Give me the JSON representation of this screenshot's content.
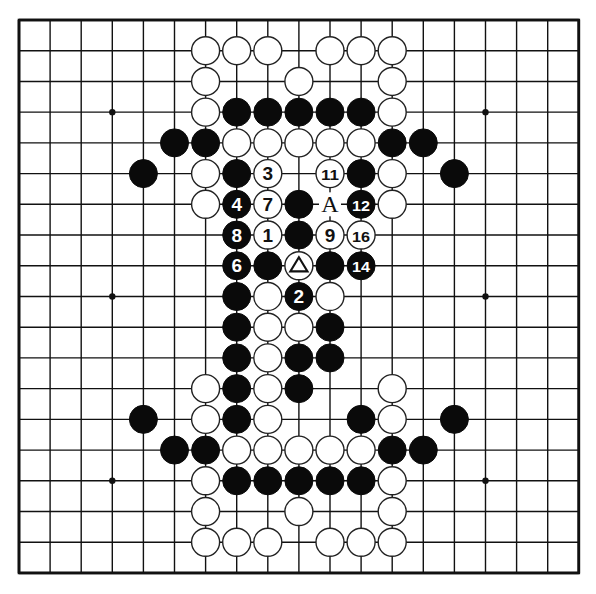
{
  "board": {
    "size": 19,
    "origin_x": 19,
    "origin_y": 20,
    "spacing_x": 31.1,
    "spacing_y": 30.72,
    "stone_radius": 14,
    "line_color": "#111111",
    "border_width": 2.6,
    "line_width": 1.4,
    "star_points": [
      [
        3,
        3
      ],
      [
        9,
        3
      ],
      [
        15,
        3
      ],
      [
        3,
        9
      ],
      [
        15,
        9
      ],
      [
        3,
        15
      ],
      [
        9,
        15
      ],
      [
        15,
        15
      ]
    ]
  },
  "colors": {
    "black_stone": "#0a0a0a",
    "white_stone": "#ffffff",
    "white_stone_border": "#222222",
    "background": "#ffffff"
  },
  "stones": [
    {
      "c": 6,
      "r": 1,
      "color": "W"
    },
    {
      "c": 7,
      "r": 1,
      "color": "W"
    },
    {
      "c": 8,
      "r": 1,
      "color": "W"
    },
    {
      "c": 10,
      "r": 1,
      "color": "W"
    },
    {
      "c": 11,
      "r": 1,
      "color": "W"
    },
    {
      "c": 12,
      "r": 1,
      "color": "W"
    },
    {
      "c": 6,
      "r": 2,
      "color": "W"
    },
    {
      "c": 9,
      "r": 2,
      "color": "W"
    },
    {
      "c": 12,
      "r": 2,
      "color": "W"
    },
    {
      "c": 6,
      "r": 3,
      "color": "W"
    },
    {
      "c": 7,
      "r": 3,
      "color": "B"
    },
    {
      "c": 8,
      "r": 3,
      "color": "B"
    },
    {
      "c": 9,
      "r": 3,
      "color": "B"
    },
    {
      "c": 10,
      "r": 3,
      "color": "B"
    },
    {
      "c": 11,
      "r": 3,
      "color": "B"
    },
    {
      "c": 12,
      "r": 3,
      "color": "W"
    },
    {
      "c": 5,
      "r": 4,
      "color": "B"
    },
    {
      "c": 6,
      "r": 4,
      "color": "B"
    },
    {
      "c": 7,
      "r": 4,
      "color": "W"
    },
    {
      "c": 8,
      "r": 4,
      "color": "W"
    },
    {
      "c": 9,
      "r": 4,
      "color": "W"
    },
    {
      "c": 10,
      "r": 4,
      "color": "W"
    },
    {
      "c": 11,
      "r": 4,
      "color": "W"
    },
    {
      "c": 12,
      "r": 4,
      "color": "B"
    },
    {
      "c": 13,
      "r": 4,
      "color": "B"
    },
    {
      "c": 4,
      "r": 5,
      "color": "B"
    },
    {
      "c": 6,
      "r": 5,
      "color": "W"
    },
    {
      "c": 7,
      "r": 5,
      "color": "B"
    },
    {
      "c": 8,
      "r": 5,
      "color": "W",
      "label": "3"
    },
    {
      "c": 10,
      "r": 5,
      "color": "W",
      "label": "11"
    },
    {
      "c": 11,
      "r": 5,
      "color": "B"
    },
    {
      "c": 12,
      "r": 5,
      "color": "W"
    },
    {
      "c": 14,
      "r": 5,
      "color": "B"
    },
    {
      "c": 6,
      "r": 6,
      "color": "W"
    },
    {
      "c": 7,
      "r": 6,
      "color": "B",
      "label": "4"
    },
    {
      "c": 8,
      "r": 6,
      "color": "W",
      "label": "7"
    },
    {
      "c": 9,
      "r": 6,
      "color": "B"
    },
    {
      "c": 11,
      "r": 6,
      "color": "B",
      "label": "12"
    },
    {
      "c": 12,
      "r": 6,
      "color": "W"
    },
    {
      "c": 7,
      "r": 7,
      "color": "B",
      "label": "8"
    },
    {
      "c": 8,
      "r": 7,
      "color": "W",
      "label": "1"
    },
    {
      "c": 9,
      "r": 7,
      "color": "B"
    },
    {
      "c": 10,
      "r": 7,
      "color": "W",
      "label": "9"
    },
    {
      "c": 11,
      "r": 7,
      "color": "W",
      "label": "16"
    },
    {
      "c": 7,
      "r": 8,
      "color": "B",
      "label": "6"
    },
    {
      "c": 8,
      "r": 8,
      "color": "B"
    },
    {
      "c": 9,
      "r": 8,
      "color": "W",
      "label": "triangle"
    },
    {
      "c": 10,
      "r": 8,
      "color": "B"
    },
    {
      "c": 11,
      "r": 8,
      "color": "B",
      "label": "14"
    },
    {
      "c": 7,
      "r": 9,
      "color": "B"
    },
    {
      "c": 8,
      "r": 9,
      "color": "W"
    },
    {
      "c": 9,
      "r": 9,
      "color": "B",
      "label": "2"
    },
    {
      "c": 10,
      "r": 9,
      "color": "W"
    },
    {
      "c": 7,
      "r": 10,
      "color": "B"
    },
    {
      "c": 8,
      "r": 10,
      "color": "W"
    },
    {
      "c": 9,
      "r": 10,
      "color": "W"
    },
    {
      "c": 10,
      "r": 10,
      "color": "B"
    },
    {
      "c": 7,
      "r": 11,
      "color": "B"
    },
    {
      "c": 8,
      "r": 11,
      "color": "W"
    },
    {
      "c": 9,
      "r": 11,
      "color": "B"
    },
    {
      "c": 10,
      "r": 11,
      "color": "B"
    },
    {
      "c": 6,
      "r": 12,
      "color": "W"
    },
    {
      "c": 7,
      "r": 12,
      "color": "B"
    },
    {
      "c": 8,
      "r": 12,
      "color": "W"
    },
    {
      "c": 9,
      "r": 12,
      "color": "B"
    },
    {
      "c": 12,
      "r": 12,
      "color": "W"
    },
    {
      "c": 4,
      "r": 13,
      "color": "B"
    },
    {
      "c": 6,
      "r": 13,
      "color": "W"
    },
    {
      "c": 7,
      "r": 13,
      "color": "B"
    },
    {
      "c": 8,
      "r": 13,
      "color": "W"
    },
    {
      "c": 11,
      "r": 13,
      "color": "B"
    },
    {
      "c": 12,
      "r": 13,
      "color": "W"
    },
    {
      "c": 14,
      "r": 13,
      "color": "B"
    },
    {
      "c": 5,
      "r": 14,
      "color": "B"
    },
    {
      "c": 6,
      "r": 14,
      "color": "B"
    },
    {
      "c": 7,
      "r": 14,
      "color": "W"
    },
    {
      "c": 8,
      "r": 14,
      "color": "W"
    },
    {
      "c": 9,
      "r": 14,
      "color": "W"
    },
    {
      "c": 10,
      "r": 14,
      "color": "W"
    },
    {
      "c": 11,
      "r": 14,
      "color": "W"
    },
    {
      "c": 12,
      "r": 14,
      "color": "B"
    },
    {
      "c": 13,
      "r": 14,
      "color": "B"
    },
    {
      "c": 6,
      "r": 15,
      "color": "W"
    },
    {
      "c": 7,
      "r": 15,
      "color": "B"
    },
    {
      "c": 8,
      "r": 15,
      "color": "B"
    },
    {
      "c": 9,
      "r": 15,
      "color": "B"
    },
    {
      "c": 10,
      "r": 15,
      "color": "B"
    },
    {
      "c": 11,
      "r": 15,
      "color": "B"
    },
    {
      "c": 12,
      "r": 15,
      "color": "W"
    },
    {
      "c": 6,
      "r": 16,
      "color": "W"
    },
    {
      "c": 9,
      "r": 16,
      "color": "W"
    },
    {
      "c": 12,
      "r": 16,
      "color": "W"
    },
    {
      "c": 6,
      "r": 17,
      "color": "W"
    },
    {
      "c": 7,
      "r": 17,
      "color": "W"
    },
    {
      "c": 8,
      "r": 17,
      "color": "W"
    },
    {
      "c": 10,
      "r": 17,
      "color": "W"
    },
    {
      "c": 11,
      "r": 17,
      "color": "W"
    },
    {
      "c": 12,
      "r": 17,
      "color": "W"
    }
  ],
  "point_labels": [
    {
      "c": 10,
      "r": 6,
      "text": "A"
    }
  ]
}
